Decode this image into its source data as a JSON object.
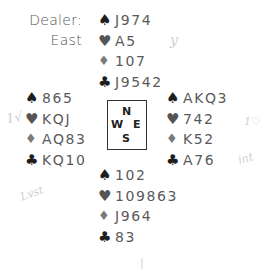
{
  "dealer": {
    "label": "Dealer:",
    "value": "East"
  },
  "compass": {
    "north": "N",
    "west": "W",
    "east": "E",
    "south": "S"
  },
  "suits": {
    "spade": "♠",
    "heart": "♥",
    "diamond": "♦",
    "club": "♣",
    "colors": {
      "spade": "#1e1e1e",
      "heart": "#555555",
      "diamond": "#7a7a7a",
      "club": "#1e1e1e"
    }
  },
  "hands": {
    "north": {
      "spades": "J974",
      "hearts": "A5",
      "diamonds": "107",
      "clubs": "J9542"
    },
    "west": {
      "spades": "865",
      "hearts": "KQJ",
      "diamonds": "AQ83",
      "clubs": "KQ10"
    },
    "east": {
      "spades": "AKQ3",
      "hearts": "742",
      "diamonds": "K52",
      "clubs": "A76"
    },
    "south": {
      "spades": "102",
      "hearts": "109863",
      "diamonds": "J964",
      "clubs": "83"
    }
  },
  "annotations": {
    "north_mark": "y",
    "west_mark": "1√",
    "east_mark_1": "1♡",
    "east_mark_2": "int",
    "west_low_mark": "Lvst",
    "south_mark": "|"
  }
}
